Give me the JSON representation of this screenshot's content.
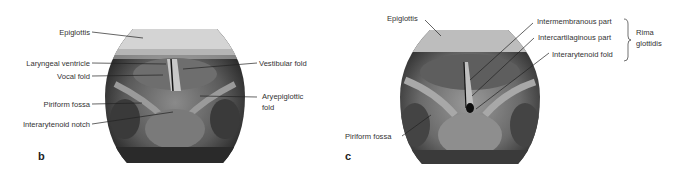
{
  "figure": {
    "panels": [
      {
        "letter": "b",
        "labels": {
          "epiglottis": "Epiglottis",
          "laryngeal_ventricle": "Laryngeal ventricle",
          "vocal_fold": "Vocal fold",
          "piriform_fossa": "Piriform fossa",
          "interarytenoid_notch": "Interarytenoid notch",
          "vestibular_fold": "Vestibular fold",
          "aryepiglottic_fold_line1": "Aryepiglottic",
          "aryepiglottic_fold_line2": "fold"
        }
      },
      {
        "letter": "c",
        "labels": {
          "epiglottis": "Epiglottis",
          "intermembranous_part": "Intermembranous part",
          "intercartilaginous_part": "Intercartilaginous part",
          "interarytenoid_fold": "Interarytenoid fold",
          "rima_line1": "Rima",
          "rima_line2": "glottidis",
          "piriform_fossa": "Piriform fossa"
        }
      }
    ]
  }
}
